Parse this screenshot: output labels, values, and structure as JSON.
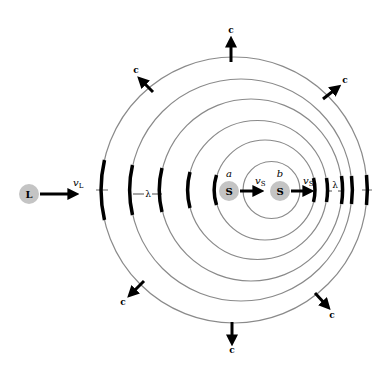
{
  "diagram": {
    "listener": {
      "label": "L",
      "velocity_label": "v",
      "velocity_sub": "L"
    },
    "sources": [
      {
        "tag": "a",
        "label": "S",
        "velocity_label": "v",
        "velocity_sub": "S"
      },
      {
        "tag": "b",
        "label": "S",
        "velocity_label": "v",
        "velocity_sub": "S"
      }
    ],
    "wave_speed_label": "c",
    "wavelength_label": "λ",
    "colors": {
      "circle": "#8a8a8a",
      "dot": "#c4c4c4",
      "arrow": "#000000"
    }
  }
}
